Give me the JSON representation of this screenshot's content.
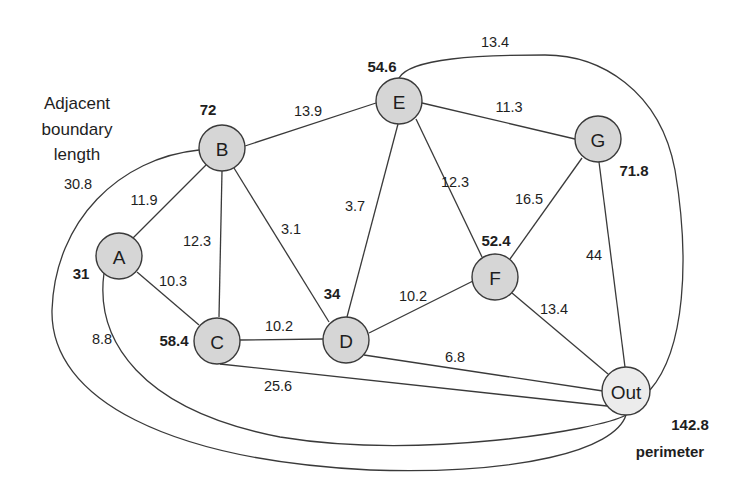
{
  "title_caption": {
    "lines": [
      "Adjacent",
      "boundary",
      "length"
    ]
  },
  "nodes": [
    {
      "id": "A",
      "label": "A",
      "total": "31"
    },
    {
      "id": "B",
      "label": "B",
      "total": "72"
    },
    {
      "id": "C",
      "label": "C",
      "total": "58.4"
    },
    {
      "id": "D",
      "label": "D",
      "total": "34"
    },
    {
      "id": "E",
      "label": "E",
      "total": "54.6"
    },
    {
      "id": "F",
      "label": "F",
      "total": "52.4"
    },
    {
      "id": "G",
      "label": "G",
      "total": "71.8"
    },
    {
      "id": "Out",
      "label": "Out",
      "total": "142.8",
      "total_caption": "perimeter"
    }
  ],
  "edges": [
    {
      "from": "A",
      "to": "B",
      "weight": "11.9"
    },
    {
      "from": "A",
      "to": "C",
      "weight": "10.3"
    },
    {
      "from": "A",
      "to": "Out",
      "weight": "8.8"
    },
    {
      "from": "B",
      "to": "C",
      "weight": "12.3"
    },
    {
      "from": "B",
      "to": "D",
      "weight": "3.1"
    },
    {
      "from": "B",
      "to": "E",
      "weight": "13.9"
    },
    {
      "from": "B",
      "to": "Out",
      "weight": "30.8"
    },
    {
      "from": "C",
      "to": "D",
      "weight": "10.2"
    },
    {
      "from": "C",
      "to": "Out",
      "weight": "25.6"
    },
    {
      "from": "D",
      "to": "E",
      "weight": "3.7"
    },
    {
      "from": "D",
      "to": "F",
      "weight": "10.2"
    },
    {
      "from": "D",
      "to": "Out",
      "weight": "6.8"
    },
    {
      "from": "E",
      "to": "F",
      "weight": "12.3"
    },
    {
      "from": "E",
      "to": "G",
      "weight": "11.3"
    },
    {
      "from": "E",
      "to": "Out",
      "weight": "13.4"
    },
    {
      "from": "F",
      "to": "G",
      "weight": "16.5"
    },
    {
      "from": "F",
      "to": "Out",
      "weight": "13.4"
    },
    {
      "from": "G",
      "to": "Out",
      "weight": "44"
    }
  ]
}
